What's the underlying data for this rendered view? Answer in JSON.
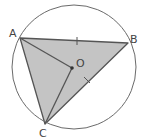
{
  "diagram": {
    "type": "geometry-circle-inscribed-triangle",
    "colors": {
      "fill": "#c4c4c4",
      "stroke": "#555555",
      "circle": "#6a6a6a"
    },
    "circle": {
      "center": "O",
      "label": "O"
    },
    "points": [
      {
        "name": "A",
        "label": "A"
      },
      {
        "name": "B",
        "label": "B"
      },
      {
        "name": "C",
        "label": "C"
      },
      {
        "name": "O",
        "label": "O"
      }
    ],
    "segments": [
      "AB",
      "BC",
      "CA",
      "AO",
      "OC"
    ],
    "shaded_region": "triangle ABC",
    "tick_marks": [
      "AB",
      "BC"
    ],
    "equal_sides_note": "AB = BC"
  }
}
